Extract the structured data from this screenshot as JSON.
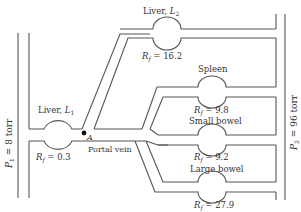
{
  "diagram": {
    "pressures": {
      "p1": {
        "symbol": "P",
        "sub": "1",
        "text": " = 8 torr"
      },
      "p2": {
        "symbol": "P",
        "sub": "2",
        "text": " = 96 torr"
      }
    },
    "point_a": {
      "label": "A"
    },
    "portal_vein": {
      "label": "Portal vein"
    },
    "organs": [
      {
        "id": "liver-l1",
        "name": "Liver, ",
        "symbol": "L",
        "sub": "1",
        "rf_symbol": "R",
        "rf_sub": "f",
        "rf_value": " = 0.3"
      },
      {
        "id": "liver-l2",
        "name": "Liver, ",
        "symbol": "L",
        "sub": "2",
        "rf_symbol": "R",
        "rf_sub": "f",
        "rf_value": " = 16.2"
      },
      {
        "id": "spleen",
        "name": "Spleen",
        "rf_symbol": "R",
        "rf_sub": "f",
        "rf_value": " = 9.8"
      },
      {
        "id": "small-bowel",
        "name": "Small bowel",
        "rf_symbol": "R",
        "rf_sub": "f",
        "rf_value": " = 9.2"
      },
      {
        "id": "large-bowel",
        "name": "Large bowel",
        "rf_symbol": "R",
        "rf_sub": "f",
        "rf_value": " = 27.9"
      }
    ],
    "colors": {
      "line": "#555555",
      "text": "#333333",
      "background": "#ffffff"
    }
  }
}
